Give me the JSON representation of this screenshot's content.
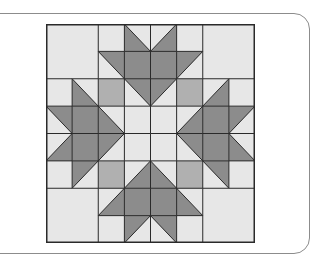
{
  "colors": {
    "light": "#e7e7e7",
    "mid": "#b0b0b0",
    "dark": "#8c8c8c",
    "line": "#2a2a2a"
  },
  "grid": {
    "rows": 8,
    "cols": 8,
    "cells": [
      [
        "L",
        "L",
        "L",
        "bl",
        "br",
        "L",
        "L",
        "L"
      ],
      [
        "L",
        "L",
        "tr",
        "D",
        "D",
        "tl",
        "L",
        "L"
      ],
      [
        "L",
        "bl",
        "M",
        "tr",
        "tl",
        "M",
        "br",
        "L"
      ],
      [
        "tr",
        "D",
        "bl",
        "L",
        "L",
        "br",
        "D",
        "tl"
      ],
      [
        "br",
        "D",
        "tl",
        "L",
        "L",
        "tr",
        "D",
        "bl"
      ],
      [
        "L",
        "tl",
        "M",
        "br",
        "bl",
        "M",
        "tr",
        "L"
      ],
      [
        "L",
        "L",
        "br",
        "D",
        "D",
        "bl",
        "L",
        "L"
      ],
      [
        "L",
        "L",
        "L",
        "tl",
        "tr",
        "L",
        "L",
        "L"
      ]
    ],
    "merged_blocks": [
      {
        "row": 0,
        "col": 0,
        "rows": 2,
        "cols": 2,
        "fill": "L"
      },
      {
        "row": 0,
        "col": 6,
        "rows": 2,
        "cols": 2,
        "fill": "L"
      },
      {
        "row": 6,
        "col": 0,
        "rows": 2,
        "cols": 2,
        "fill": "L"
      },
      {
        "row": 6,
        "col": 6,
        "rows": 2,
        "cols": 2,
        "fill": "L"
      }
    ]
  },
  "legend_key": {
    "L": "light fabric",
    "M": "medium fabric",
    "D": "dark fabric",
    "tl": "half-square triangle, dark top-left",
    "tr": "half-square triangle, dark top-right",
    "bl": "half-square triangle, dark bottom-left",
    "br": "half-square triangle, dark bottom-right"
  }
}
